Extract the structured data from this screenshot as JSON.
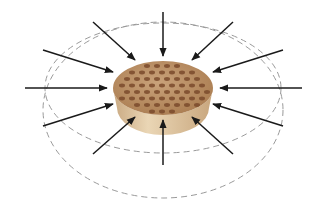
{
  "diagram": {
    "title": "",
    "colors": {
      "background": "#ffffff",
      "arrow": "#1a1a1a",
      "dashed_ellipse": "#9a9a9a",
      "disc_top": "#b98a5e",
      "disc_top_light": "#c9a27a",
      "disc_side": "#e2cba8",
      "disc_side_shade": "#c9a982",
      "spot": "#7a4a2c"
    },
    "disc": {
      "cx": 163,
      "cy": 88,
      "rx": 50,
      "ry": 27,
      "depth": 20
    },
    "ellipses": [
      {
        "name": "outer",
        "cx": 163,
        "cy": 110,
        "rx": 120,
        "ry": 88
      },
      {
        "name": "inner",
        "cx": 163,
        "cy": 88,
        "rx": 118,
        "ry": 65
      }
    ],
    "arrows": [
      {
        "name": "top",
        "x1": 163,
        "y1": 12,
        "x2": 163,
        "y2": 56
      },
      {
        "name": "top-right",
        "x1": 233,
        "y1": 22,
        "x2": 192,
        "y2": 60
      },
      {
        "name": "right-upper",
        "x1": 283,
        "y1": 50,
        "x2": 213,
        "y2": 72
      },
      {
        "name": "right",
        "x1": 302,
        "y1": 88,
        "x2": 220,
        "y2": 88
      },
      {
        "name": "right-lower",
        "x1": 283,
        "y1": 126,
        "x2": 213,
        "y2": 104
      },
      {
        "name": "bottom-right",
        "x1": 233,
        "y1": 154,
        "x2": 192,
        "y2": 117
      },
      {
        "name": "bottom",
        "x1": 163,
        "y1": 165,
        "x2": 163,
        "y2": 120
      },
      {
        "name": "bottom-left",
        "x1": 93,
        "y1": 154,
        "x2": 135,
        "y2": 117
      },
      {
        "name": "left-lower",
        "x1": 43,
        "y1": 126,
        "x2": 113,
        "y2": 104
      },
      {
        "name": "left",
        "x1": 25,
        "y1": 88,
        "x2": 107,
        "y2": 88
      },
      {
        "name": "left-upper",
        "x1": 43,
        "y1": 50,
        "x2": 113,
        "y2": 72
      },
      {
        "name": "top-left",
        "x1": 93,
        "y1": 22,
        "x2": 135,
        "y2": 60
      }
    ],
    "arrow_count": 12
  }
}
